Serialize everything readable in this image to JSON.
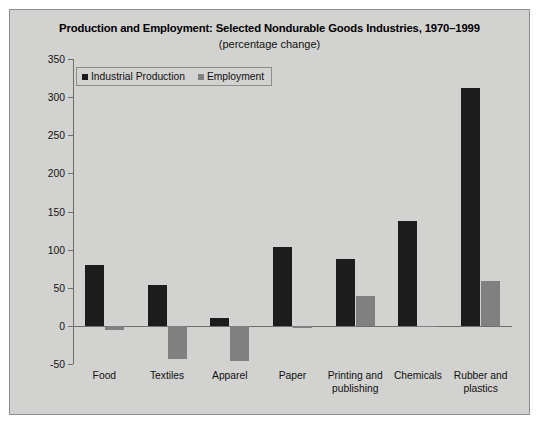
{
  "chart_data": {
    "type": "bar",
    "title": "Production and Employment: Selected Nondurable Goods Industries, 1970–1999",
    "subtitle": "(percentage change)",
    "xlabel": "",
    "ylabel": "",
    "ylim": [
      -50,
      350
    ],
    "yticks": [
      -50,
      0,
      50,
      100,
      150,
      200,
      250,
      300,
      350
    ],
    "ytick_labels": [
      "-50",
      "0",
      "50",
      "100",
      "150",
      "200",
      "250",
      "300",
      "350"
    ],
    "grid": false,
    "legend_position": "top-left",
    "categories": [
      "Food",
      "Textiles",
      "Apparel",
      "Paper",
      "Printing and publishing",
      "Chemicals",
      "Rubber and plastics"
    ],
    "category_lines": [
      [
        "Food"
      ],
      [
        "Textiles"
      ],
      [
        "Apparel"
      ],
      [
        "Paper"
      ],
      [
        "Printing and",
        "publishing"
      ],
      [
        "Chemicals"
      ],
      [
        "Rubber and",
        "plastics"
      ]
    ],
    "series": [
      {
        "name": "Industrial Production",
        "color": "#1c1c1c",
        "values": [
          80,
          54,
          10,
          103,
          88,
          137,
          312
        ]
      },
      {
        "name": "Employment",
        "color": "#808080",
        "values": [
          -5,
          -44,
          -46,
          -3,
          39,
          -2,
          59
        ]
      }
    ]
  },
  "figure": {
    "background_color": "#d2d2d0",
    "border_color": "#8d8d8b",
    "axis_color": "#6e6e6c"
  }
}
